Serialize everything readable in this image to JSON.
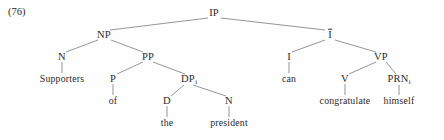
{
  "figure": {
    "example_number": "(76)",
    "type": "syntax-tree",
    "sentence": "Supporters of the president can congratulate himself",
    "line_color": "#8a8a8a",
    "text_color": "#2a2a2a",
    "background": "#fefefe"
  },
  "nodes": [
    {
      "id": "IP",
      "label": "IP",
      "sub": "",
      "kind": "cat",
      "x": 214,
      "y": 13
    },
    {
      "id": "NP",
      "label": "NP",
      "sub": "",
      "kind": "cat",
      "x": 104,
      "y": 35
    },
    {
      "id": "Ibar",
      "label": "I",
      "sub": "",
      "kind": "cat",
      "x": 330,
      "y": 35,
      "overbar": true
    },
    {
      "id": "N",
      "label": "N",
      "sub": "",
      "kind": "cat",
      "x": 62,
      "y": 57
    },
    {
      "id": "PP",
      "label": "PP",
      "sub": "",
      "kind": "cat",
      "x": 148,
      "y": 57
    },
    {
      "id": "I",
      "label": "I",
      "sub": "",
      "kind": "cat",
      "x": 289,
      "y": 57
    },
    {
      "id": "VP",
      "label": "VP",
      "sub": "",
      "kind": "cat",
      "x": 381,
      "y": 57
    },
    {
      "id": "P",
      "label": "P",
      "sub": "",
      "kind": "cat",
      "x": 113,
      "y": 79
    },
    {
      "id": "DP",
      "label": "DP",
      "sub": "i",
      "kind": "cat",
      "x": 189,
      "y": 79
    },
    {
      "id": "V",
      "label": "V",
      "sub": "",
      "kind": "cat",
      "x": 345,
      "y": 79
    },
    {
      "id": "PRN",
      "label": "PRN",
      "sub": "i",
      "kind": "cat",
      "x": 399,
      "y": 79
    },
    {
      "id": "D",
      "label": "D",
      "sub": "",
      "kind": "cat",
      "x": 167,
      "y": 101
    },
    {
      "id": "Nprez",
      "label": "N",
      "sub": "",
      "kind": "cat",
      "x": 229,
      "y": 101
    },
    {
      "id": "Supporters",
      "label": "Supporters",
      "sub": "",
      "kind": "word",
      "x": 62,
      "y": 79
    },
    {
      "id": "of",
      "label": "of",
      "sub": "",
      "kind": "word",
      "x": 113,
      "y": 101
    },
    {
      "id": "can",
      "label": "can",
      "sub": "",
      "kind": "word",
      "x": 289,
      "y": 79
    },
    {
      "id": "congratulate",
      "label": "congratulate",
      "sub": "",
      "kind": "word",
      "x": 345,
      "y": 101
    },
    {
      "id": "himself",
      "label": "himself",
      "sub": "",
      "kind": "word",
      "x": 399,
      "y": 101
    },
    {
      "id": "the",
      "label": "the",
      "sub": "",
      "kind": "word",
      "x": 167,
      "y": 123
    },
    {
      "id": "president",
      "label": "president",
      "sub": "",
      "kind": "word",
      "x": 229,
      "y": 123
    }
  ],
  "edges": [
    {
      "from": "IP",
      "to": "NP",
      "x1": 208,
      "y1": 18,
      "x2": 110,
      "y2": 30
    },
    {
      "from": "IP",
      "to": "Ibar",
      "x1": 221,
      "y1": 18,
      "x2": 325,
      "y2": 30
    },
    {
      "from": "NP",
      "to": "N",
      "x1": 98,
      "y1": 40,
      "x2": 66,
      "y2": 52
    },
    {
      "from": "NP",
      "to": "PP",
      "x1": 111,
      "y1": 40,
      "x2": 143,
      "y2": 52
    },
    {
      "from": "Ibar",
      "to": "I",
      "x1": 325,
      "y1": 40,
      "x2": 292,
      "y2": 52
    },
    {
      "from": "Ibar",
      "to": "VP",
      "x1": 335,
      "y1": 40,
      "x2": 376,
      "y2": 52
    },
    {
      "from": "N",
      "to": "Supporters",
      "x1": 62,
      "y1": 62,
      "x2": 62,
      "y2": 73
    },
    {
      "from": "PP",
      "to": "P",
      "x1": 143,
      "y1": 62,
      "x2": 117,
      "y2": 74
    },
    {
      "from": "PP",
      "to": "DP",
      "x1": 153,
      "y1": 62,
      "x2": 185,
      "y2": 74
    },
    {
      "from": "I",
      "to": "can",
      "x1": 289,
      "y1": 62,
      "x2": 289,
      "y2": 73
    },
    {
      "from": "VP",
      "to": "V",
      "x1": 376,
      "y1": 62,
      "x2": 349,
      "y2": 74
    },
    {
      "from": "VP",
      "to": "PRN",
      "x1": 386,
      "y1": 62,
      "x2": 396,
      "y2": 74
    },
    {
      "from": "P",
      "to": "of",
      "x1": 113,
      "y1": 84,
      "x2": 113,
      "y2": 95
    },
    {
      "from": "DP",
      "to": "D",
      "x1": 184,
      "y1": 85,
      "x2": 171,
      "y2": 96
    },
    {
      "from": "DP",
      "to": "Nprez",
      "x1": 193,
      "y1": 85,
      "x2": 226,
      "y2": 96
    },
    {
      "from": "V",
      "to": "congratulate",
      "x1": 345,
      "y1": 84,
      "x2": 345,
      "y2": 95
    },
    {
      "from": "PRN",
      "to": "himself",
      "x1": 399,
      "y1": 85,
      "x2": 399,
      "y2": 95
    },
    {
      "from": "D",
      "to": "the",
      "x1": 167,
      "y1": 106,
      "x2": 167,
      "y2": 117
    },
    {
      "from": "Nprez",
      "to": "president",
      "x1": 229,
      "y1": 106,
      "x2": 229,
      "y2": 117
    }
  ]
}
